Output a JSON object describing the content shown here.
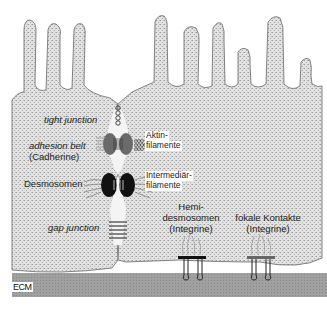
{
  "diagram": {
    "type": "cell-junctions",
    "labels": {
      "tight_junction": "tight junction",
      "adhesion_belt": "adhesion belt",
      "cadherine": "(Cadherine)",
      "desmosomen": "Desmosomen",
      "gap_junction": "gap junction",
      "aktin_1": "Aktin-",
      "aktin_2": "filamente",
      "intermed_1": "Intermediär-",
      "intermed_2": "filamente",
      "hemi_1": "Hemi-",
      "hemi_2": "desmosomen",
      "hemi_3": "(Integrine)",
      "fokal_1": "fokale Kontakte",
      "fokal_2": "(Integrine)",
      "ecm": "ECM"
    },
    "colors": {
      "cell_fill": "#d9d9d9",
      "ecm_fill": "#9a9a9a",
      "outline": "#555555",
      "desmosome": "#111111",
      "belt": "#6a6a6a"
    }
  }
}
